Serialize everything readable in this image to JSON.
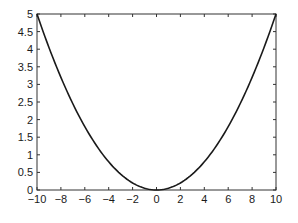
{
  "chart_data": {
    "type": "line",
    "title": "",
    "xlabel": "",
    "ylabel": "",
    "xlim": [
      -10,
      10
    ],
    "ylim": [
      0,
      5
    ],
    "grid": false,
    "legend": null,
    "x_ticks": [
      "-10",
      "-8",
      "-6",
      "-4",
      "-2",
      "0",
      "2",
      "4",
      "6",
      "8",
      "10"
    ],
    "y_ticks": [
      "0",
      "0.5",
      "1",
      "1.5",
      "2",
      "2.5",
      "3",
      "3.5",
      "4",
      "4.5",
      "5"
    ],
    "series": [
      {
        "name": "y = 0.05x^2",
        "color": "#1a1a1a",
        "x": [
          -10,
          -9,
          -8,
          -7,
          -6,
          -5,
          -4,
          -3,
          -2,
          -1,
          0,
          1,
          2,
          3,
          4,
          5,
          6,
          7,
          8,
          9,
          10
        ],
        "y": [
          5,
          4.05,
          3.2,
          2.45,
          1.8,
          1.25,
          0.8,
          0.45,
          0.2,
          0.05,
          0,
          0.05,
          0.2,
          0.45,
          0.8,
          1.25,
          1.8,
          2.45,
          3.2,
          4.05,
          5
        ]
      }
    ]
  },
  "colors": {
    "axis": "#333333",
    "line": "#1a1a1a",
    "background": "#ffffff"
  }
}
